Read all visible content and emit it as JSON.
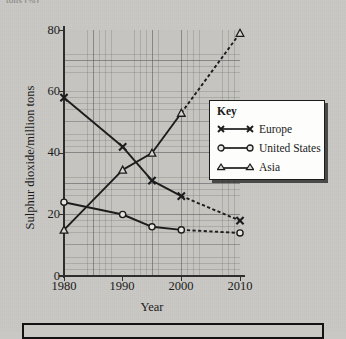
{
  "page": {
    "cropped_header_text": "tons (%)",
    "background_color": "#c9c8c4"
  },
  "legend": {
    "title": "Key",
    "entries": [
      {
        "label": "Europe",
        "marker": "cross-marker",
        "color": "#1c1c1c"
      },
      {
        "label": "United States",
        "marker": "circle-marker",
        "color": "#1c1c1c"
      },
      {
        "label": "Asia",
        "marker": "triangle-marker",
        "color": "#1c1c1c"
      }
    ]
  },
  "axes": {
    "y_label": "Sulphur dioxide/million tons",
    "x_label": "Year",
    "y_ticks": [
      "0",
      "20",
      "40",
      "60",
      "80"
    ],
    "x_ticks": [
      "1980",
      "1990",
      "2000",
      "2010"
    ]
  },
  "chart_data": {
    "type": "line",
    "title": "",
    "xlabel": "Year",
    "ylabel": "Sulphur dioxide/million tons",
    "xlim": [
      1980,
      2010
    ],
    "ylim": [
      0,
      80
    ],
    "x": [
      1980,
      1990,
      1995,
      2000,
      2010
    ],
    "grid": true,
    "minor_grid": true,
    "legend_position": "inside-right",
    "y_ticks": [
      0,
      20,
      40,
      60,
      80
    ],
    "x_ticks": [
      1980,
      1990,
      2000,
      2010
    ],
    "x_minor_ticks": [
      1985,
      1995,
      2005
    ],
    "series": [
      {
        "name": "Europe",
        "marker": "cross",
        "values": [
          58,
          42,
          31,
          26,
          18
        ],
        "solid_until": 2000,
        "dashed_after": true,
        "color": "#1c1c1c"
      },
      {
        "name": "United States",
        "marker": "circle",
        "values": [
          24,
          20,
          16,
          15,
          14
        ],
        "solid_until": 2000,
        "dashed_after": true,
        "color": "#1c1c1c"
      },
      {
        "name": "Asia",
        "marker": "triangle",
        "values": [
          15,
          34.5,
          40,
          53,
          79
        ],
        "solid_until": 2000,
        "dashed_after": true,
        "color": "#1c1c1c"
      }
    ]
  }
}
